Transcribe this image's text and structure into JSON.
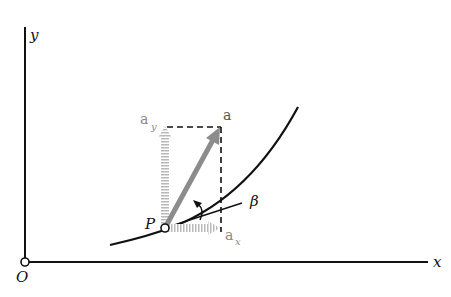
{
  "diagram": {
    "labels": {
      "y_axis": "y",
      "x_axis": "x",
      "origin": "O",
      "point": "P",
      "angle": "β",
      "vector": "a",
      "x_component": "a",
      "x_component_sub": "x",
      "y_component": "a",
      "y_component_sub": "y"
    },
    "colors": {
      "axis": "#111111",
      "curve": "#111111",
      "vector": "#8c8c8c",
      "components": "#b5b5b5",
      "dashed": "#111111"
    }
  }
}
